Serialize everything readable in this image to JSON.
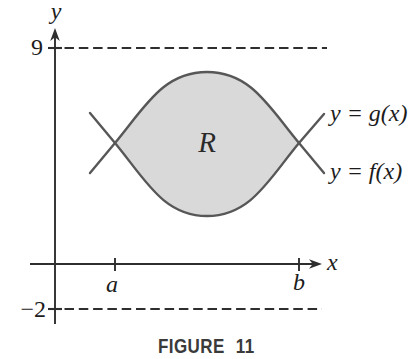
{
  "figure": {
    "caption": "FIGURE 11",
    "labels": {
      "y_axis": "y",
      "x_axis": "x",
      "upper_dashed_value": "9",
      "lower_dashed_value": "−2",
      "left_bound": "a",
      "right_bound": "b",
      "region": "R",
      "upper_curve": "y = g(x)",
      "lower_curve": "y = f(x)"
    },
    "colors": {
      "region_fill": "#d9d9d9",
      "curve_stroke": "#575757",
      "axis_stroke": "#2e2e2e",
      "dashed_stroke": "#2e2e2e",
      "label_text": "#1c1c1c",
      "caption_text": "#3a3a3a"
    }
  }
}
